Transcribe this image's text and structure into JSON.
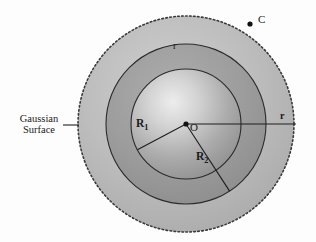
{
  "figure": {
    "type": "physics-diagram",
    "background_color": "#fdfdfd"
  },
  "geometry": {
    "center": {
      "x": 186,
      "y": 124,
      "label": "O"
    },
    "circles": [
      {
        "name": "gaussian-surface",
        "radius": 108,
        "style": "dotted",
        "fill": "#b9b9b9",
        "label": "r"
      },
      {
        "name": "outer-shell",
        "radius": 80,
        "style": "solid",
        "fill": "#9e9e9e",
        "label": "R2"
      },
      {
        "name": "inner-sphere",
        "radius": 55,
        "style": "solid",
        "fill": "#a8a8a8",
        "label": "R1"
      }
    ],
    "radius_lines": [
      {
        "name": "R1",
        "angle_deg": 208,
        "length": 55
      },
      {
        "name": "R2",
        "angle_deg": 57,
        "length": 80
      },
      {
        "name": "r",
        "angle_deg": 0,
        "length": 108
      }
    ],
    "point_C": {
      "x": 250,
      "y": 24
    }
  },
  "labels": {
    "gaussian_line1": "Gaussian",
    "gaussian_line2": "Surface",
    "R1": "R",
    "R1_sub": "1",
    "R2": "R",
    "R2_sub": "2",
    "center": "O",
    "r_top": "r",
    "r_right": "r",
    "point_c": "C"
  },
  "colors": {
    "outer_region": "#b9b9b9",
    "middle_region": "#9b9b9b",
    "inner_sphere_light": "#e8e8e8",
    "inner_sphere_dark": "#8f8f8f",
    "stroke": "#2b2b2b",
    "text": "#1a1a1a"
  }
}
